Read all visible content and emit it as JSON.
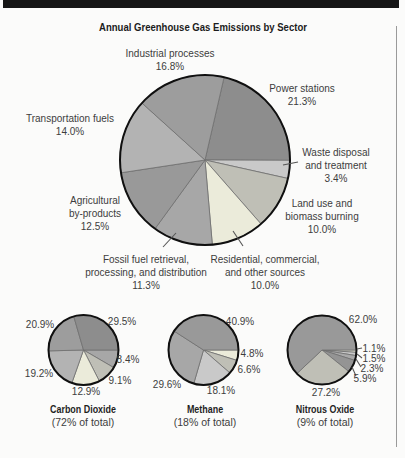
{
  "page": {
    "top_bar_color": "#161616",
    "edge_rule_color": "#9a9a9a",
    "background": "#fbfbfa",
    "label_color": "#3d3d3d",
    "outline_color": "#101010",
    "slice_divider_color": "#6e6e6e"
  },
  "chart_data": {
    "type": "pie",
    "title": "Annual Greenhouse Gas Emissions by Sector",
    "unit": "percent",
    "direction": "clockwise",
    "pies": [
      {
        "id": "main",
        "cx": 205,
        "cy": 160,
        "r": 85,
        "start_angle_deg": 77,
        "slices": [
          {
            "label": "Power stations",
            "value": 21.3,
            "color": "#8d8d8d"
          },
          {
            "label": "Waste disposal and treatment",
            "value": 3.4,
            "color": "#c9c9c9"
          },
          {
            "label": "Land use and biomass burning",
            "value": 10.0,
            "color": "#bfbfb6"
          },
          {
            "label": "Residential, commercial, and other sources",
            "value": 10.0,
            "color": "#ebebda"
          },
          {
            "label": "Fossil fuel retrieval, processing, and distribution",
            "value": 11.3,
            "color": "#a7a7a7"
          },
          {
            "label": "Agricultural by-products",
            "value": 12.5,
            "color": "#999999"
          },
          {
            "label": "Transportation fuels",
            "value": 14.0,
            "color": "#b3b3b3"
          },
          {
            "label": "Industrial processes",
            "value": 16.8,
            "color": "#9d9d9d"
          }
        ],
        "labels": [
          {
            "x": 170,
            "y": 53,
            "lines": [
              "Industrial processes",
              "16.8%"
            ]
          },
          {
            "x": 302,
            "y": 88,
            "lines": [
              "Power stations",
              "21.3%"
            ]
          },
          {
            "x": 70,
            "y": 118,
            "lines": [
              "Transportation fuels",
              "14.0%"
            ]
          },
          {
            "x": 336,
            "y": 152,
            "lines": [
              "Waste disposal",
              "and treatment",
              "3.4%"
            ]
          },
          {
            "x": 322,
            "y": 203,
            "lines": [
              "Land use and",
              "biomass burning",
              "10.0%"
            ]
          },
          {
            "x": 95,
            "y": 200,
            "lines": [
              "Agricultural",
              "by-products",
              "12.5%"
            ]
          },
          {
            "x": 146,
            "y": 259,
            "lines": [
              "Fossil fuel retrieval,",
              "processing, and distribution",
              "11.3%"
            ]
          },
          {
            "x": 265,
            "y": 259,
            "lines": [
              "Residential, commercial,",
              "and other sources",
              "10.0%"
            ]
          }
        ],
        "leader_lines": [
          {
            "x1": 283,
            "y1": 165,
            "x2": 298,
            "y2": 162
          },
          {
            "x1": 176,
            "y1": 233,
            "x2": 163,
            "y2": 247
          },
          {
            "x1": 233,
            "y1": 231,
            "x2": 243,
            "y2": 246
          }
        ]
      },
      {
        "id": "carbon-dioxide",
        "name": "Carbon Dioxide",
        "subtitle": "(72% of total)",
        "caption_x": 83,
        "caption_y": 403,
        "cx": 83.5,
        "cy": 350,
        "r": 35,
        "start_angle_deg": 0,
        "slices": [
          {
            "value": 8.4,
            "color": "#a7a7a7"
          },
          {
            "value": 9.1,
            "color": "#bfbfb6"
          },
          {
            "value": 12.9,
            "color": "#ebebda"
          },
          {
            "value": 19.2,
            "color": "#b3b3b3"
          },
          {
            "value": 20.9,
            "color": "#9d9d9d"
          },
          {
            "value": 29.5,
            "color": "#8d8d8d"
          }
        ],
        "labels": [
          {
            "x": 122,
            "y": 321,
            "lines": [
              "29.5%"
            ]
          },
          {
            "x": 40,
            "y": 324,
            "lines": [
              "20.9%"
            ]
          },
          {
            "x": 128,
            "y": 359,
            "lines": [
              "8.4%"
            ]
          },
          {
            "x": 39,
            "y": 373,
            "lines": [
              "19.2%"
            ]
          },
          {
            "x": 120,
            "y": 380,
            "lines": [
              "9.1%"
            ]
          },
          {
            "x": 86,
            "y": 391,
            "lines": [
              "12.9%"
            ]
          }
        ],
        "leader_lines": []
      },
      {
        "id": "methane",
        "name": "Methane",
        "subtitle": "(18% of total)",
        "caption_x": 205,
        "caption_y": 403,
        "cx": 203.5,
        "cy": 350,
        "r": 35,
        "start_angle_deg": 0,
        "slices": [
          {
            "value": 4.8,
            "color": "#ebebda"
          },
          {
            "value": 6.6,
            "color": "#bfbfb6"
          },
          {
            "value": 18.1,
            "color": "#c9c9c9"
          },
          {
            "value": 29.6,
            "color": "#a7a7a7"
          },
          {
            "value": 40.9,
            "color": "#999999"
          }
        ],
        "labels": [
          {
            "x": 240,
            "y": 321,
            "lines": [
              "40.9%"
            ]
          },
          {
            "x": 252,
            "y": 353,
            "lines": [
              "4.8%"
            ]
          },
          {
            "x": 249,
            "y": 369,
            "lines": [
              "6.6%"
            ]
          },
          {
            "x": 167,
            "y": 384,
            "lines": [
              "29.6%"
            ]
          },
          {
            "x": 221,
            "y": 390,
            "lines": [
              "18.1%"
            ]
          }
        ],
        "leader_lines": []
      },
      {
        "id": "nitrous-oxide",
        "name": "Nitrous Oxide",
        "subtitle": "(9% of total)",
        "caption_x": 325,
        "caption_y": 403,
        "cx": 322,
        "cy": 350,
        "r": 34.5,
        "start_angle_deg": 0,
        "slices": [
          {
            "value": 1.1,
            "color": "#ebebda"
          },
          {
            "value": 1.5,
            "color": "#c9c9c9"
          },
          {
            "value": 2.3,
            "color": "#a9a9a9"
          },
          {
            "value": 5.9,
            "color": "#949494"
          },
          {
            "value": 27.2,
            "color": "#bfbfb6"
          },
          {
            "value": 62.0,
            "color": "#999999"
          }
        ],
        "labels": [
          {
            "x": 363,
            "y": 319,
            "lines": [
              "62.0%"
            ]
          },
          {
            "x": 374,
            "y": 348,
            "lines": [
              "1.1%"
            ]
          },
          {
            "x": 374,
            "y": 358,
            "lines": [
              "1.5%"
            ]
          },
          {
            "x": 372,
            "y": 368,
            "lines": [
              "2.3%"
            ]
          },
          {
            "x": 365,
            "y": 378,
            "lines": [
              "5.9%"
            ]
          },
          {
            "x": 326,
            "y": 392,
            "lines": [
              "27.2%"
            ]
          }
        ],
        "leader_lines": [
          {
            "x1": 357,
            "y1": 349,
            "x2": 362,
            "y2": 348
          },
          {
            "x1": 357,
            "y1": 354,
            "x2": 362,
            "y2": 358
          },
          {
            "x1": 356,
            "y1": 359,
            "x2": 361,
            "y2": 367
          },
          {
            "x1": 352,
            "y1": 367,
            "x2": 356,
            "y2": 376
          }
        ]
      }
    ]
  }
}
